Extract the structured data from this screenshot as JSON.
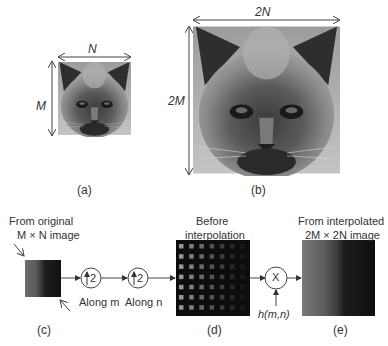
{
  "panels": {
    "a": {
      "caption": "(a)",
      "width_label": "N",
      "height_label": "M"
    },
    "b": {
      "caption": "(b)",
      "width_label": "2N",
      "height_label": "2M"
    },
    "c": {
      "caption": "(c)",
      "title_line1": "From original",
      "title_line2": "M × N image"
    },
    "d": {
      "caption": "(d)",
      "title_line1": "Before",
      "title_line2": "interpolation"
    },
    "e": {
      "caption": "(e)",
      "title_line1": "From interpolated",
      "title_line2": "2M × 2N image"
    }
  },
  "operators": {
    "upsample_m": {
      "symbol": "2",
      "label": "Along m",
      "icon": "up-arrow-icon"
    },
    "upsample_n": {
      "symbol": "2",
      "label": "Along n",
      "icon": "up-arrow-icon"
    },
    "multiply": {
      "symbol": "X",
      "input_label": "h(m,n)"
    }
  },
  "colors": {
    "background": "#ffffff",
    "line": "#444444",
    "grid_bg": "#0d0d0d"
  }
}
